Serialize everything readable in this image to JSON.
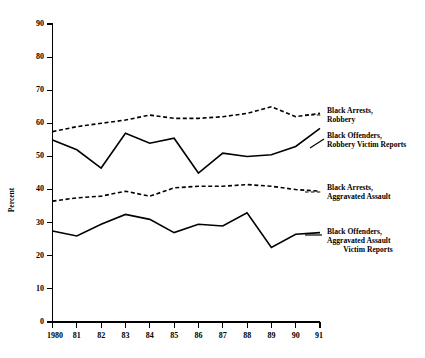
{
  "chart_data": {
    "type": "line",
    "title": "",
    "subtitle": "",
    "xlabel": "",
    "ylabel": "Percent",
    "xlim": [
      1980,
      1991
    ],
    "ylim": [
      0,
      90
    ],
    "grid": false,
    "legend_position": "right-inline-annotations",
    "x": [
      1980,
      1981,
      1982,
      1983,
      1984,
      1985,
      1986,
      1987,
      1988,
      1989,
      1990,
      1991
    ],
    "xtick_labels": [
      "1980",
      "81",
      "82",
      "83",
      "84",
      "85",
      "86",
      "87",
      "88",
      "89",
      "90",
      "91"
    ],
    "ytick_labels": [
      "0",
      "10",
      "20",
      "30",
      "40",
      "50",
      "60",
      "70",
      "80",
      "90"
    ],
    "yticks": [
      0,
      10,
      20,
      30,
      40,
      50,
      60,
      70,
      80,
      90
    ],
    "series": [
      {
        "name": "Black Arrests, Robbery",
        "style": "dashed",
        "label_lines": [
          "Black Arrests,",
          "Robbery"
        ],
        "values": [
          57.5,
          59.0,
          60.0,
          61.0,
          62.5,
          61.5,
          61.5,
          62.0,
          63.0,
          65.0,
          62.0,
          63.0
        ]
      },
      {
        "name": "Black Offenders, Robbery Victim Reports",
        "style": "solid",
        "label_lines": [
          "Black Offenders,",
          "Robbery Victim Reports"
        ],
        "values": [
          55.0,
          52.0,
          46.5,
          57.0,
          54.0,
          55.5,
          45.0,
          51.0,
          50.0,
          50.5,
          53.0,
          58.5
        ]
      },
      {
        "name": "Black Arrests, Aggravated Assault",
        "style": "dashed",
        "label_lines": [
          "Black Arrests,",
          "Aggravated Assault"
        ],
        "values": [
          36.5,
          37.5,
          38.0,
          39.5,
          38.0,
          40.5,
          41.0,
          41.0,
          41.5,
          41.0,
          40.0,
          39.5
        ]
      },
      {
        "name": "Black Offenders, Aggravated Assault Victim Reports",
        "style": "solid",
        "label_lines": [
          "Black Offenders,",
          "Aggravated Assault",
          "Victim Reports"
        ],
        "values": [
          27.5,
          26.0,
          29.5,
          32.5,
          31.0,
          27.0,
          29.5,
          29.0,
          33.0,
          22.5,
          26.5,
          27.0
        ]
      }
    ]
  },
  "axis": {
    "y_title": "Percent"
  },
  "annotations": {
    "robbery_arrests": {
      "line1": "Black Arrests,",
      "line2": "Robbery"
    },
    "robbery_offenders": {
      "line1": "Black Offenders,",
      "line2": "Robbery Victim Reports"
    },
    "assault_arrests": {
      "line1": "Black Arrests,",
      "line2": "Aggravated Assault"
    },
    "assault_offenders": {
      "line1": "Black Offenders,",
      "line2": "Aggravated Assault",
      "line3": "Victim Reports"
    }
  },
  "colors": {
    "ink": "#000000",
    "background": "#ffffff"
  }
}
